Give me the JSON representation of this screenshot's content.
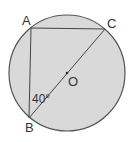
{
  "diagram": {
    "type": "geometry",
    "colors": {
      "circle_fill": "#d9d9d9",
      "stroke": "#555555",
      "text": "#333333"
    },
    "points": {
      "A": "A",
      "B": "B",
      "C": "C",
      "O": "O"
    },
    "segments": [
      "AB",
      "AC",
      "BC"
    ],
    "angle": {
      "vertex": "B",
      "between": [
        "AB",
        "BC"
      ],
      "label": "40°"
    }
  }
}
